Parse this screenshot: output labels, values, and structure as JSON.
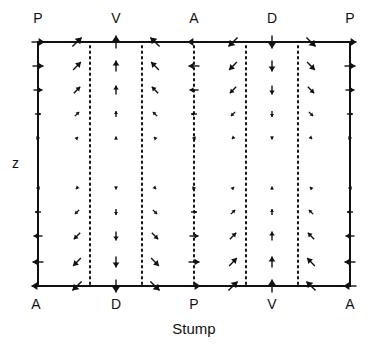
{
  "figure": {
    "top_labels": [
      "P",
      "V",
      "A",
      "D",
      "P"
    ],
    "bottom_labels": [
      "A",
      "D",
      "P",
      "V",
      "A"
    ],
    "axis_label_z": "z",
    "caption": "Stump",
    "page_mark": "355"
  },
  "geometry": {
    "frame": {
      "left": 38,
      "right": 350,
      "top": 42,
      "bottom": 286
    },
    "dotted_lines_x": [
      90,
      142,
      194,
      246,
      298
    ],
    "columns_x": [
      38,
      77,
      116,
      155,
      194,
      233,
      272,
      311,
      350
    ],
    "top_label_x": [
      38,
      116,
      194,
      272,
      350
    ],
    "rows_top_y": [
      42,
      66,
      90,
      114,
      138
    ],
    "rows_bottom_y": [
      188,
      212,
      236,
      262,
      286
    ],
    "magnitudes_top": [
      13,
      11,
      9,
      6,
      3
    ],
    "magnitudes_bottom": [
      3,
      6,
      9,
      11,
      13
    ]
  },
  "vector_field": {
    "description": "Top half directions per column (dx, dy in screen coords); bottom half is reversed",
    "top_directions": [
      [
        1,
        0
      ],
      [
        0.707,
        -0.707
      ],
      [
        0,
        -1
      ],
      [
        -0.707,
        -0.707
      ],
      [
        -1,
        0
      ],
      [
        -0.707,
        0.707
      ],
      [
        0,
        1
      ],
      [
        0.707,
        0.707
      ],
      [
        1,
        0
      ]
    ]
  },
  "colors": {
    "ink": "#111111",
    "background": "#ffffff"
  }
}
